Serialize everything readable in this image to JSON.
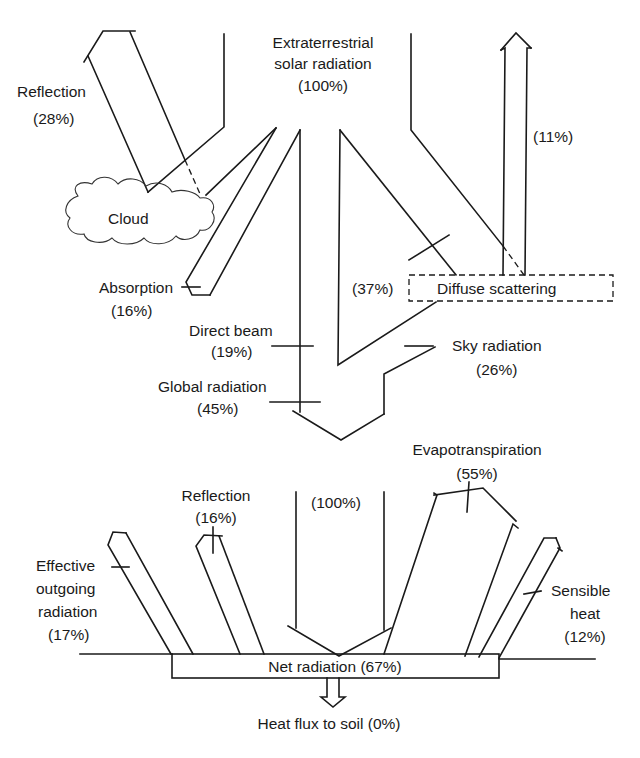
{
  "diagram": {
    "colors": {
      "line": "#1a1a1a",
      "background": "#ffffff"
    },
    "upper": {
      "extraterrestrial": {
        "line1": "Extraterrestrial",
        "line2": "solar radiation",
        "value": "(100%)"
      },
      "reflection": {
        "label": "Reflection",
        "value": "(28%)"
      },
      "cloud": {
        "label": "Cloud"
      },
      "absorption": {
        "label": "Absorption",
        "value": "(16%)"
      },
      "scatter_up": {
        "value": "(11%)"
      },
      "diffuse": {
        "label": "Diffuse scattering",
        "value": "(37%)"
      },
      "direct_beam": {
        "label": "Direct beam",
        "value": "(19%)"
      },
      "sky_radiation": {
        "label": "Sky radiation",
        "value": "(26%)"
      },
      "global_radiation": {
        "label": "Global radiation",
        "value": "(45%)"
      }
    },
    "lower": {
      "incoming": {
        "value": "(100%)"
      },
      "reflection": {
        "label": "Reflection",
        "value": "(16%)"
      },
      "effective_outgoing": {
        "line1": "Effective",
        "line2": "outgoing",
        "line3": "radiation",
        "value": "(17%)"
      },
      "evapotranspiration": {
        "label": "Evapotranspiration",
        "value": "(55%)"
      },
      "sensible_heat": {
        "line1": "Sensible",
        "line2": "heat",
        "value": "(12%)"
      },
      "net_radiation": {
        "label": "Net radiation (67%)"
      },
      "heat_flux": {
        "label": "Heat flux to soil (0%)"
      }
    }
  }
}
